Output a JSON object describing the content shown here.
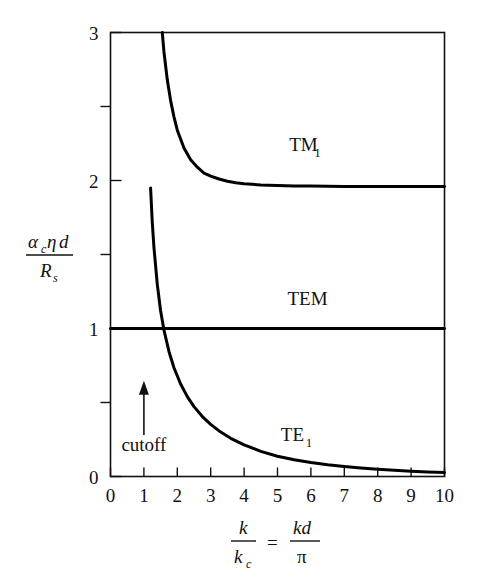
{
  "chart_data": {
    "type": "line",
    "title": "",
    "xlabel": "k/k_c = kd/pi",
    "ylabel": "alpha_c * eta * d / R_s",
    "xlim": [
      0,
      10
    ],
    "ylim": [
      0,
      3
    ],
    "grid": false,
    "legend_position": "inline-curve-labels",
    "xticks": [
      "0",
      "1",
      "2",
      "3",
      "4",
      "5",
      "6",
      "7",
      "8",
      "9",
      "10"
    ],
    "xtick_values": [
      0,
      1,
      2,
      3,
      4,
      5,
      6,
      7,
      8,
      9,
      10
    ],
    "yticks": [
      "0",
      "1",
      "2",
      "3"
    ],
    "ytick_values": [
      0,
      1,
      2,
      3
    ],
    "yminor_values": [
      0.5,
      1.5,
      2.5
    ],
    "series": [
      {
        "name": "TM1",
        "label": "TM",
        "label_sub": "1",
        "label_x": 5.35,
        "label_y": 2.2,
        "color": "#000000",
        "x": [
          1.55,
          1.6,
          1.7,
          1.8,
          1.9,
          2.0,
          2.2,
          2.4,
          2.6,
          2.8,
          3.0,
          3.25,
          3.5,
          3.75,
          4.0,
          4.5,
          5.0,
          5.5,
          6.0,
          6.5,
          7.0,
          7.5,
          8.0,
          8.5,
          9.0,
          9.5,
          10.0
        ],
        "y": [
          3.0,
          2.87,
          2.68,
          2.54,
          2.43,
          2.34,
          2.22,
          2.14,
          2.09,
          2.05,
          2.03,
          2.01,
          1.995,
          1.985,
          1.978,
          1.97,
          1.966,
          1.963,
          1.962,
          1.961,
          1.96,
          1.96,
          1.96,
          1.96,
          1.96,
          1.96,
          1.96
        ]
      },
      {
        "name": "TEM",
        "label": "TEM",
        "label_sub": "",
        "label_x": 5.3,
        "label_y": 1.16,
        "color": "#000000",
        "x": [
          0,
          10
        ],
        "y": [
          1.0,
          1.0
        ]
      },
      {
        "name": "TE1",
        "label": "TE",
        "label_sub": "1",
        "label_x": 5.1,
        "label_y": 0.24,
        "color": "#000000",
        "x": [
          1.2,
          1.25,
          1.3,
          1.4,
          1.5,
          1.6,
          1.75,
          1.9,
          2.1,
          2.3,
          2.5,
          2.75,
          3.0,
          3.3,
          3.6,
          4.0,
          4.5,
          5.0,
          5.5,
          6.0,
          6.5,
          7.0,
          7.5,
          8.0,
          8.5,
          9.0,
          9.5,
          10.0
        ],
        "y": [
          1.95,
          1.72,
          1.55,
          1.3,
          1.12,
          0.99,
          0.845,
          0.735,
          0.625,
          0.54,
          0.472,
          0.405,
          0.352,
          0.3,
          0.258,
          0.214,
          0.17,
          0.137,
          0.113,
          0.094,
          0.079,
          0.067,
          0.057,
          0.049,
          0.042,
          0.036,
          0.031,
          0.027
        ]
      }
    ],
    "annotations": [
      {
        "name": "cutoff",
        "text": "cutoff",
        "x": 1.0,
        "y": 0.17,
        "arrow_from_y": 0.28,
        "arrow_to_y": 0.62,
        "arrow_direction": "up"
      }
    ]
  },
  "axis_labels": {
    "y": {
      "numerator": {
        "alpha": "α",
        "alpha_sub": "c",
        "eta": "η",
        "d": "d"
      },
      "denominator": {
        "R": "R",
        "R_sub": "s"
      }
    },
    "x": {
      "left_numerator": "k",
      "left_denominator": "k",
      "left_denominator_sub": "c",
      "equals": "=",
      "right_numerator": "kd",
      "right_denominator": "π"
    }
  },
  "style": {
    "axis_color": "#111111",
    "curve_color": "#000000",
    "background": "#ffffff"
  }
}
